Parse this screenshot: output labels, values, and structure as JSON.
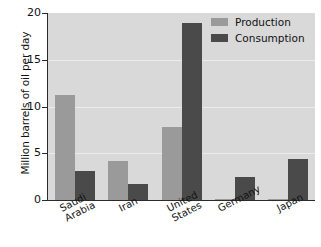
{
  "chart_data": {
    "type": "bar",
    "title": "",
    "xlabel": "",
    "ylabel": "Million barrels of oil per day",
    "ylim": [
      0,
      20
    ],
    "yticks": [
      0,
      5,
      10,
      15,
      20
    ],
    "ytick_labels": [
      "0",
      "5",
      "10",
      "15",
      "20"
    ],
    "grid": true,
    "grid_axis": "y",
    "legend_position": "top-right",
    "categories": [
      "Saudi Arabia",
      "Iran",
      "United States",
      "Germany",
      "Japan"
    ],
    "category_lines": [
      [
        "Saudi",
        "Arabia"
      ],
      [
        "Iran"
      ],
      [
        "United",
        "States"
      ],
      [
        "Germany"
      ],
      [
        "Japan"
      ]
    ],
    "series": [
      {
        "name": "Production",
        "color": "#9a9a9a",
        "values": [
          11.2,
          4.2,
          7.8,
          0.15,
          0.1
        ]
      },
      {
        "name": "Consumption",
        "color": "#4a4a4a",
        "values": [
          3.1,
          1.7,
          18.9,
          2.5,
          4.4
        ]
      }
    ]
  },
  "legend": {
    "items": [
      {
        "label": "Production",
        "swatch": "production"
      },
      {
        "label": "Consumption",
        "swatch": "consumption"
      }
    ]
  },
  "colors": {
    "production": "#9a9a9a",
    "consumption": "#4a4a4a",
    "plot_background": "#d9d9d9",
    "gridline": "#efefef",
    "axis": "#2b2b2b",
    "page_background": "#ffffff",
    "text": "#111111"
  }
}
